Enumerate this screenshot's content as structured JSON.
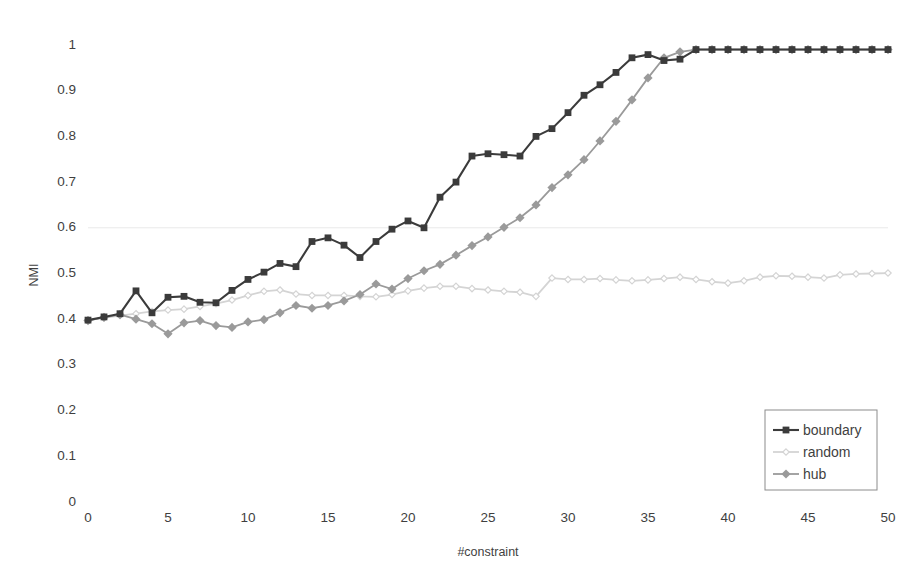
{
  "chart_data": {
    "type": "line",
    "title": "",
    "xlabel": "#constraint",
    "ylabel": "NMI",
    "xlim": [
      0,
      50
    ],
    "ylim": [
      0,
      1
    ],
    "xticks": [
      0,
      5,
      10,
      15,
      20,
      25,
      30,
      35,
      40,
      45,
      50
    ],
    "yticks": [
      0,
      0.1,
      0.2,
      0.3,
      0.4,
      0.5,
      0.6,
      0.7,
      0.8,
      0.9,
      1
    ],
    "ytick_labels": [
      "0",
      "0.1",
      "0.2",
      "0.3",
      "0.4",
      "0.5",
      "0.6",
      "0.7",
      "0.8",
      "0.9",
      "1"
    ],
    "xtick_labels": [
      "0",
      "5",
      "10",
      "15",
      "20",
      "25",
      "30",
      "35",
      "40",
      "45",
      "50"
    ],
    "grid": "horizontal-faint-0.6-only",
    "legend_position": "bottom-right",
    "x": [
      0,
      1,
      2,
      3,
      4,
      5,
      6,
      7,
      8,
      9,
      10,
      11,
      12,
      13,
      14,
      15,
      16,
      17,
      18,
      19,
      20,
      21,
      22,
      23,
      24,
      25,
      26,
      27,
      28,
      29,
      30,
      31,
      32,
      33,
      34,
      35,
      36,
      37,
      38,
      39,
      40,
      41,
      42,
      43,
      44,
      45,
      46,
      47,
      48,
      49,
      50
    ],
    "series": [
      {
        "name": "boundary",
        "color": "#3b3b3b",
        "marker": "square",
        "values": [
          0.398,
          0.405,
          0.412,
          0.462,
          0.414,
          0.448,
          0.45,
          0.437,
          0.436,
          0.463,
          0.487,
          0.503,
          0.522,
          0.515,
          0.57,
          0.578,
          0.562,
          0.535,
          0.57,
          0.597,
          0.615,
          0.6,
          0.667,
          0.7,
          0.757,
          0.762,
          0.76,
          0.757,
          0.8,
          0.817,
          0.852,
          0.89,
          0.913,
          0.94,
          0.972,
          0.979,
          0.966,
          0.969,
          0.99,
          0.99,
          0.99,
          0.99,
          0.99,
          0.99,
          0.99,
          0.99,
          0.99,
          0.99,
          0.99,
          0.99,
          0.99
        ]
      },
      {
        "name": "random",
        "color": "#d4d4d4",
        "marker": "diamond-small",
        "values": [
          0.398,
          0.403,
          0.408,
          0.412,
          0.417,
          0.42,
          0.422,
          0.428,
          0.434,
          0.442,
          0.452,
          0.461,
          0.464,
          0.455,
          0.452,
          0.452,
          0.452,
          0.45,
          0.449,
          0.454,
          0.462,
          0.468,
          0.472,
          0.472,
          0.467,
          0.464,
          0.461,
          0.459,
          0.45,
          0.49,
          0.487,
          0.487,
          0.489,
          0.486,
          0.484,
          0.486,
          0.489,
          0.492,
          0.487,
          0.482,
          0.479,
          0.484,
          0.492,
          0.495,
          0.494,
          0.492,
          0.49,
          0.497,
          0.499,
          0.5,
          0.501
        ]
      },
      {
        "name": "hub",
        "color": "#9a9a9a",
        "marker": "diamond",
        "values": [
          0.397,
          0.404,
          0.41,
          0.4,
          0.39,
          0.368,
          0.392,
          0.397,
          0.386,
          0.382,
          0.394,
          0.399,
          0.414,
          0.43,
          0.424,
          0.43,
          0.44,
          0.454,
          0.477,
          0.466,
          0.489,
          0.506,
          0.52,
          0.54,
          0.561,
          0.58,
          0.601,
          0.622,
          0.65,
          0.688,
          0.716,
          0.749,
          0.79,
          0.833,
          0.88,
          0.928,
          0.972,
          0.985,
          0.99,
          0.99,
          0.99,
          0.99,
          0.99,
          0.99,
          0.99,
          0.99,
          0.99,
          0.99,
          0.99,
          0.99,
          0.99
        ]
      }
    ]
  },
  "legend": {
    "items": [
      {
        "label": "boundary"
      },
      {
        "label": "random"
      },
      {
        "label": "hub"
      }
    ]
  },
  "axes": {
    "y_title": "NMI",
    "x_title": "#constraint"
  }
}
